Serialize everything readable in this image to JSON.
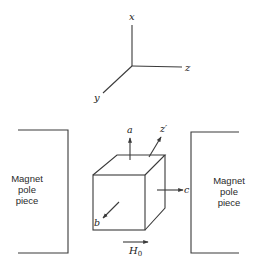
{
  "diagram": {
    "axes": {
      "x_label": "x",
      "y_label": "y",
      "z_label": "z"
    },
    "crystal": {
      "axis_labels": {
        "a": "a",
        "b": "b",
        "c": "c",
        "z_prime": "z′"
      }
    },
    "field": {
      "symbol": "H",
      "subscript": "0"
    },
    "left_pole": {
      "line1": "Magnet",
      "line2": "pole",
      "line3": "piece"
    },
    "right_pole": {
      "line1": "Magnet",
      "line2": "pole",
      "line3": "piece"
    },
    "colors": {
      "ink": "#3a3a3a",
      "background": "#ffffff"
    }
  }
}
